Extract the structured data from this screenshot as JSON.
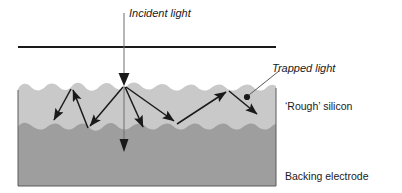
{
  "figure": {
    "labels": {
      "incident_light": "Incident light",
      "trapped_light": "Trapped light",
      "rough_silicon": "‘Rough’ silicon",
      "backing_electrode_line1": "Backing electrode",
      "backing_electrode_line2": "(reflecting aluminium)"
    },
    "colors": {
      "silicon_fill": "#c9c9c9",
      "electrode_fill": "#9e9e9e",
      "stroke": "#1a1a1a",
      "thin_stroke": "#555555",
      "background": "#ffffff"
    },
    "geometry": {
      "surface_reference_line_y": 47,
      "surface_reference_line_x_start": 18,
      "surface_reference_line_x_end": 276,
      "block_left": 18,
      "block_right": 276,
      "block_bottom": 186,
      "silicon_top_nominal_y": 86,
      "interface_nominal_y": 126,
      "incident_beam_x": 124,
      "incident_beam_top_y": 13,
      "incident_impact_point": [
        124,
        85
      ],
      "trapped_light_dot": [
        247,
        97
      ]
    },
    "ray_paths": [
      {
        "name": "incident-beam",
        "points": [
          [
            124,
            13
          ],
          [
            124,
            85
          ]
        ],
        "arrow": "end"
      },
      {
        "name": "transmitted-beam",
        "points": [
          [
            124,
            85
          ],
          [
            124,
            152
          ]
        ],
        "arrow": "end"
      },
      {
        "name": "scatter-down-right",
        "points": [
          [
            124,
            86
          ],
          [
            144,
            130
          ]
        ],
        "arrow": "end"
      },
      {
        "name": "scatter-down-far-right",
        "points": [
          [
            124,
            86
          ],
          [
            176,
            123
          ]
        ],
        "arrow": "end"
      },
      {
        "name": "scatter-up-left",
        "points": [
          [
            124,
            85
          ],
          [
            88,
            128
          ]
        ],
        "arrow": "end"
      },
      {
        "name": "bounce-left-up",
        "points": [
          [
            88,
            128
          ],
          [
            72,
            88
          ]
        ],
        "arrow": "end"
      },
      {
        "name": "bounce-left-down",
        "points": [
          [
            72,
            88
          ],
          [
            52,
            122
          ]
        ],
        "arrow": "end"
      },
      {
        "name": "bounce-right-up",
        "points": [
          [
            176,
            123
          ],
          [
            228,
            90
          ]
        ],
        "arrow": "end"
      },
      {
        "name": "bounce-right-down",
        "points": [
          [
            228,
            90
          ],
          [
            258,
            116
          ]
        ],
        "arrow": "end"
      },
      {
        "name": "trapped-light-leader",
        "points": [
          [
            247,
            97
          ],
          [
            278,
            72
          ]
        ],
        "arrow": "none"
      }
    ]
  }
}
